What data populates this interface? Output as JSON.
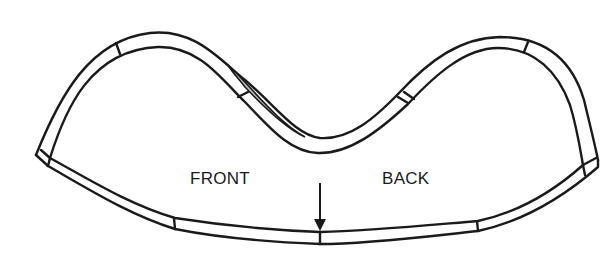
{
  "diagram": {
    "type": "pattern-piece outline (curved band, top view)",
    "labels": {
      "front": "FRONT",
      "back": "BACK"
    },
    "arrow": {
      "direction": "down",
      "meaning": "center mark",
      "x": 320
    },
    "colors": {
      "stroke": "#1a1a1a",
      "background": "#ffffff",
      "shading": "#bdbdbd"
    }
  }
}
